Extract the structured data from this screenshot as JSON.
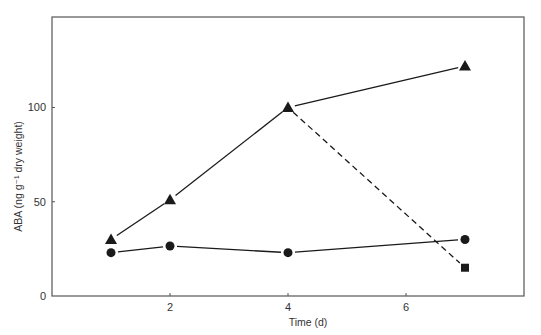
{
  "chart_data": {
    "type": "line",
    "title": "",
    "xlabel": "Time (d)",
    "ylabel": "ABA (ng g⁻¹ dry weight)",
    "xlim": [
      0,
      8
    ],
    "ylim": [
      0,
      148
    ],
    "xticks": [
      2,
      4,
      6
    ],
    "yticks": [
      0,
      50,
      100
    ],
    "grid": false,
    "legend": null,
    "series": [
      {
        "name": "triangle-series",
        "marker": "triangle",
        "line_style": "solid",
        "x": [
          1,
          2,
          4,
          7
        ],
        "y": [
          30,
          51,
          100,
          122
        ]
      },
      {
        "name": "circle-series",
        "marker": "circle",
        "line_style": "solid",
        "x": [
          1,
          2,
          4,
          7
        ],
        "y": [
          23,
          26.5,
          23,
          30
        ]
      },
      {
        "name": "square-series",
        "marker": "square",
        "line_style": "dashed",
        "x": [
          4,
          7
        ],
        "y": [
          100,
          15
        ]
      }
    ]
  },
  "axes": {
    "x_title": "Time (d)",
    "y_title": "ABA (ng g⁻¹ dry weight)",
    "x_tick_labels": [
      "2",
      "4",
      "6"
    ],
    "y_tick_labels": [
      "0",
      "50",
      "100"
    ]
  },
  "colors": {
    "line": "#1a1a1a",
    "frame": "#555555",
    "text": "#333333"
  }
}
